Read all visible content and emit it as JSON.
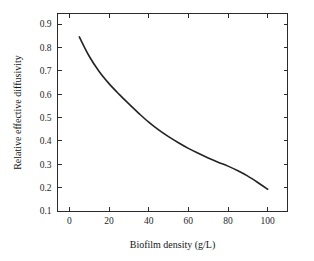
{
  "chart_data": {
    "type": "line",
    "title": "",
    "xlabel": "Biofilm density (g/L)",
    "ylabel": "Relative effective diffusivity",
    "xlim": [
      -6,
      110
    ],
    "ylim": [
      0.1,
      0.945
    ],
    "xticks": [
      0,
      20,
      40,
      60,
      80,
      100
    ],
    "xticklabels": [
      "0",
      "20",
      "40",
      "60",
      "80",
      "100"
    ],
    "yticks": [
      0.1,
      0.2,
      0.3,
      0.4,
      0.5,
      0.6,
      0.7,
      0.8,
      0.9
    ],
    "yticklabels": [
      "0.1",
      "0.2",
      "0.3",
      "0.4",
      "0.5",
      "0.6",
      "0.7",
      "0.8",
      "0.9"
    ],
    "grid": false,
    "legend": null,
    "frame": "box",
    "series": [
      {
        "name": "Relative effective diffusivity",
        "color": "#232323",
        "x": [
          5,
          10,
          15,
          20,
          25,
          30,
          35,
          40,
          45,
          50,
          55,
          60,
          65,
          70,
          75,
          80,
          85,
          90,
          95,
          100
        ],
        "values": [
          0.845,
          0.762,
          0.697,
          0.645,
          0.6,
          0.558,
          0.518,
          0.48,
          0.447,
          0.418,
          0.392,
          0.368,
          0.347,
          0.327,
          0.309,
          0.292,
          0.272,
          0.249,
          0.222,
          0.193
        ]
      }
    ]
  },
  "axis_titles": {
    "x": "Biofilm density (g/L)",
    "y": "Relative effective diffusivity"
  }
}
